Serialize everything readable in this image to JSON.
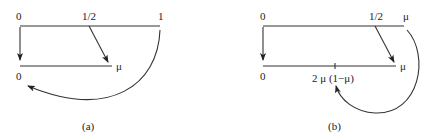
{
  "diagrams": [
    {
      "id": "a",
      "caption": "(a)",
      "top_line": {
        "labels": {
          "left": "0",
          "mid": "1/2",
          "right": "1"
        }
      },
      "bottom_line": {
        "labels": {
          "left": "0",
          "right": "μ"
        }
      },
      "arrows": [
        {
          "from": "0",
          "to": "0",
          "shape": "straight-down"
        },
        {
          "from": "1/2",
          "to": "μ",
          "shape": "diagonal"
        },
        {
          "from": "1",
          "to": "0",
          "shape": "curved"
        }
      ]
    },
    {
      "id": "b",
      "caption": "(b)",
      "top_line": {
        "labels": {
          "left": "0",
          "mid": "1/2",
          "right": "μ"
        }
      },
      "bottom_line": {
        "labels": {
          "left": "0",
          "tick": "2 μ (1−μ)",
          "right": "μ"
        }
      },
      "arrows": [
        {
          "from": "0",
          "to": "0",
          "shape": "straight-down"
        },
        {
          "from": "1/2",
          "to": "μ",
          "shape": "diagonal"
        },
        {
          "from": "μ",
          "to": "2 μ (1−μ)",
          "shape": "curved"
        }
      ]
    }
  ]
}
